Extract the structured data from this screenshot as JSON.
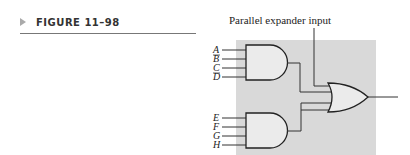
{
  "figure": {
    "label": "FIGURE 11–98"
  },
  "diagram": {
    "annotation": "Parallel expander input",
    "and_gate_1_inputs": [
      "A",
      "B",
      "C",
      "D"
    ],
    "and_gate_2_inputs": [
      "E",
      "F",
      "G",
      "H"
    ],
    "gates": [
      "and-gate-top",
      "and-gate-bottom",
      "or-gate"
    ],
    "colors": {
      "background_box": "#d9d9d9",
      "gate_fill": "#ebebeb",
      "line": "#333333"
    }
  }
}
